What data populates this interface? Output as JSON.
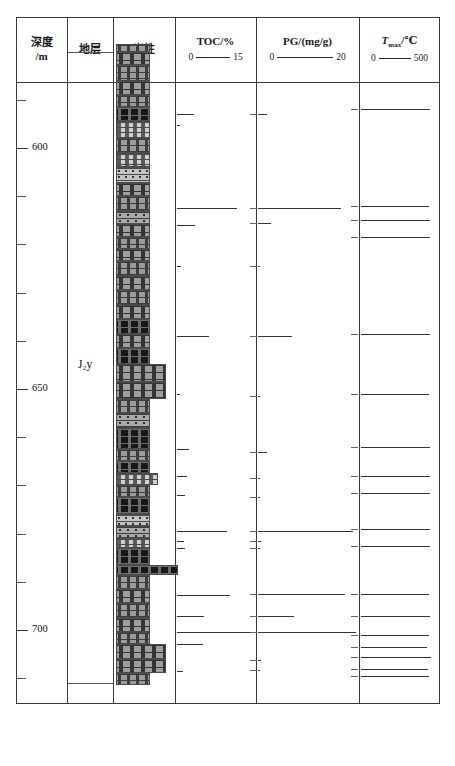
{
  "figure": {
    "type": "well-log-column",
    "title": "",
    "depth_unit": "m",
    "depth_range": [
      575,
      712
    ]
  },
  "header": {
    "columns": [
      {
        "id": "depth",
        "line1": "深度",
        "line2": "/m"
      },
      {
        "id": "strat",
        "line1": "地层",
        "line2": ""
      },
      {
        "id": "lith",
        "line1": "岩性",
        "line2": ""
      },
      {
        "id": "toc",
        "line1": "TOC/%",
        "line2": "",
        "min": "0",
        "max": "15"
      },
      {
        "id": "pg",
        "line1": "PG/(mg/g)",
        "line2": "",
        "min": "0",
        "max": "20"
      },
      {
        "id": "tmax",
        "line1": "T",
        "sub": "max",
        "line1b": "/℃",
        "min": "0",
        "max": "500"
      }
    ]
  },
  "depth_axis": {
    "labels": [
      {
        "value": "600",
        "depth": 600
      },
      {
        "value": "650",
        "depth": 650
      },
      {
        "value": "700",
        "depth": 700
      }
    ],
    "minor_tick_interval": 10
  },
  "stratigraphy": {
    "units": [
      {
        "label": "J₂y",
        "label_plain": "J2y",
        "top": 580,
        "bottom": 711
      }
    ]
  },
  "chart_data": {
    "type": "well-log",
    "title": "",
    "ylabel": "深度/m",
    "ylim": [
      575,
      712
    ],
    "tracks": [
      {
        "name": "TOC",
        "unit": "%",
        "xlim": [
          0,
          15
        ],
        "type": "bar",
        "points": [
          {
            "depth": 593.0,
            "value": 3.2
          },
          {
            "depth": 595.2,
            "value": 0.6
          },
          {
            "depth": 612.5,
            "value": 11.5
          },
          {
            "depth": 616.0,
            "value": 3.5
          },
          {
            "depth": 624.5,
            "value": 0.7
          },
          {
            "depth": 639.0,
            "value": 6.2
          },
          {
            "depth": 651.0,
            "value": 0.6
          },
          {
            "depth": 662.5,
            "value": 2.4
          },
          {
            "depth": 668.0,
            "value": 2.0
          },
          {
            "depth": 672.0,
            "value": 1.6
          },
          {
            "depth": 679.5,
            "value": 9.6
          },
          {
            "depth": 681.5,
            "value": 1.4
          },
          {
            "depth": 683.0,
            "value": 1.5
          },
          {
            "depth": 692.8,
            "value": 10.2
          },
          {
            "depth": 697.0,
            "value": 5.1
          },
          {
            "depth": 700.5,
            "value": 14.8
          },
          {
            "depth": 703.0,
            "value": 5.0
          },
          {
            "depth": 708.5,
            "value": 1.2
          }
        ]
      },
      {
        "name": "PG",
        "unit": "mg/g",
        "xlim": [
          0,
          20
        ],
        "type": "bar",
        "points": [
          {
            "depth": 593.0,
            "value": 1.9
          },
          {
            "depth": 612.5,
            "value": 16.8
          },
          {
            "depth": 615.5,
            "value": 2.7
          },
          {
            "depth": 624.5,
            "value": 0.5
          },
          {
            "depth": 639.0,
            "value": 6.9
          },
          {
            "depth": 651.5,
            "value": 0.5
          },
          {
            "depth": 663.0,
            "value": 1.9
          },
          {
            "depth": 668.5,
            "value": 0.5
          },
          {
            "depth": 672.5,
            "value": 0.4
          },
          {
            "depth": 679.5,
            "value": 19.2
          },
          {
            "depth": 681.5,
            "value": 0.7
          },
          {
            "depth": 683.0,
            "value": 0.5
          },
          {
            "depth": 692.5,
            "value": 17.5
          },
          {
            "depth": 697.0,
            "value": 7.3
          },
          {
            "depth": 700.5,
            "value": 19.8
          },
          {
            "depth": 706.2,
            "value": 0.6
          },
          {
            "depth": 708.4,
            "value": 0.5
          }
        ]
      },
      {
        "name": "Tmax",
        "unit": "℃",
        "xlim": [
          0,
          500
        ],
        "type": "bar",
        "points": [
          {
            "depth": 592.0,
            "value": 440
          },
          {
            "depth": 612.0,
            "value": 438
          },
          {
            "depth": 615.0,
            "value": 442
          },
          {
            "depth": 618.5,
            "value": 441
          },
          {
            "depth": 638.5,
            "value": 440
          },
          {
            "depth": 651.0,
            "value": 436
          },
          {
            "depth": 662.0,
            "value": 441
          },
          {
            "depth": 668.0,
            "value": 443
          },
          {
            "depth": 671.5,
            "value": 442
          },
          {
            "depth": 679.0,
            "value": 441
          },
          {
            "depth": 682.5,
            "value": 440
          },
          {
            "depth": 692.5,
            "value": 439
          },
          {
            "depth": 697.0,
            "value": 441
          },
          {
            "depth": 701.0,
            "value": 437
          },
          {
            "depth": 703.5,
            "value": 425
          },
          {
            "depth": 705.5,
            "value": 448
          },
          {
            "depth": 708.0,
            "value": 430
          },
          {
            "depth": 709.5,
            "value": 438
          }
        ]
      }
    ],
    "lithology_log": [
      {
        "depth_top": 578.5,
        "depth_bottom": 580.0,
        "code": "xly",
        "width": "narrow"
      },
      {
        "depth_top": 580.0,
        "depth_bottom": 582.8,
        "code": "ly",
        "width": "narrow"
      },
      {
        "depth_top": 582.8,
        "depth_bottom": 586.0,
        "code": "xly",
        "width": "narrow"
      },
      {
        "depth_top": 586.0,
        "depth_bottom": 589.0,
        "code": "ly",
        "width": "narrow"
      },
      {
        "depth_top": 589.0,
        "depth_bottom": 591.5,
        "code": "xly",
        "width": "narrow"
      },
      {
        "depth_top": 591.5,
        "depth_bottom": 594.5,
        "code": "tzny",
        "width": "narrow"
      },
      {
        "depth_top": 594.5,
        "depth_bottom": 598.0,
        "code": "ny",
        "width": "narrow"
      },
      {
        "depth_top": 598.0,
        "depth_bottom": 601.0,
        "code": "xly",
        "width": "narrow"
      },
      {
        "depth_top": 601.0,
        "depth_bottom": 604.0,
        "code": "ny",
        "width": "narrow"
      },
      {
        "depth_top": 604.0,
        "depth_bottom": 607.2,
        "code": "xsy",
        "width": "narrow"
      },
      {
        "depth_top": 607.2,
        "depth_bottom": 610.0,
        "code": "ly",
        "width": "narrow"
      },
      {
        "depth_top": 610.0,
        "depth_bottom": 613.0,
        "code": "xly",
        "width": "narrow"
      },
      {
        "depth_top": 613.0,
        "depth_bottom": 615.8,
        "code": "hlfsy",
        "width": "narrow"
      },
      {
        "depth_top": 615.8,
        "depth_bottom": 618.5,
        "code": "ly",
        "width": "narrow"
      },
      {
        "depth_top": 618.5,
        "depth_bottom": 621.0,
        "code": "xly",
        "width": "narrow"
      },
      {
        "depth_top": 621.0,
        "depth_bottom": 623.5,
        "code": "ly",
        "width": "narrow"
      },
      {
        "depth_top": 623.5,
        "depth_bottom": 626.5,
        "code": "xly",
        "width": "narrow"
      },
      {
        "depth_top": 626.5,
        "depth_bottom": 629.5,
        "code": "ly",
        "width": "narrow"
      },
      {
        "depth_top": 629.5,
        "depth_bottom": 632.5,
        "code": "xly",
        "width": "narrow"
      },
      {
        "depth_top": 632.5,
        "depth_bottom": 635.5,
        "code": "ly",
        "width": "narrow"
      },
      {
        "depth_top": 635.5,
        "depth_bottom": 638.5,
        "code": "tzny",
        "width": "narrow"
      },
      {
        "depth_top": 638.5,
        "depth_bottom": 641.5,
        "code": "ly",
        "width": "narrow"
      },
      {
        "depth_top": 641.5,
        "depth_bottom": 644.8,
        "code": "tzny",
        "width": "narrow"
      },
      {
        "depth_top": 644.8,
        "depth_bottom": 648.5,
        "code": "ly",
        "width": "wide"
      },
      {
        "depth_top": 648.5,
        "depth_bottom": 652.0,
        "code": "ly",
        "width": "wide"
      },
      {
        "depth_top": 652.0,
        "depth_bottom": 655.0,
        "code": "xly",
        "width": "narrow"
      },
      {
        "depth_top": 655.0,
        "depth_bottom": 658.0,
        "code": "hlfsy",
        "width": "narrow"
      },
      {
        "depth_top": 658.0,
        "depth_bottom": 662.5,
        "code": "tzny",
        "width": "narrow"
      },
      {
        "depth_top": 662.5,
        "depth_bottom": 665.0,
        "code": "xly",
        "width": "narrow"
      },
      {
        "depth_top": 665.0,
        "depth_bottom": 667.5,
        "code": "tzny",
        "width": "narrow"
      },
      {
        "depth_top": 667.5,
        "depth_bottom": 670.0,
        "code": "ny",
        "width": "medium"
      },
      {
        "depth_top": 670.0,
        "depth_bottom": 672.5,
        "code": "xly",
        "width": "narrow"
      },
      {
        "depth_top": 672.5,
        "depth_bottom": 676.0,
        "code": "tzny",
        "width": "narrow"
      },
      {
        "depth_top": 676.0,
        "depth_bottom": 678.5,
        "code": "xsy",
        "width": "narrow"
      },
      {
        "depth_top": 678.5,
        "depth_bottom": 681.0,
        "code": "hlfsy",
        "width": "narrow"
      },
      {
        "depth_top": 681.0,
        "depth_bottom": 683.0,
        "code": "ny",
        "width": "narrow"
      },
      {
        "depth_top": 683.0,
        "depth_bottom": 686.5,
        "code": "tzny",
        "width": "narrow"
      },
      {
        "depth_top": 686.5,
        "depth_bottom": 688.5,
        "code": "tzny",
        "width": "full"
      },
      {
        "depth_top": 688.5,
        "depth_bottom": 691.5,
        "code": "xly",
        "width": "narrow"
      },
      {
        "depth_top": 691.5,
        "depth_bottom": 694.5,
        "code": "ly",
        "width": "narrow"
      },
      {
        "depth_top": 694.5,
        "depth_bottom": 697.5,
        "code": "xly",
        "width": "narrow"
      },
      {
        "depth_top": 697.5,
        "depth_bottom": 700.5,
        "code": "ly",
        "width": "narrow"
      },
      {
        "depth_top": 700.5,
        "depth_bottom": 703.0,
        "code": "xly",
        "width": "narrow"
      },
      {
        "depth_top": 703.0,
        "depth_bottom": 706.0,
        "code": "ly",
        "width": "wide"
      },
      {
        "depth_top": 706.0,
        "depth_bottom": 709.0,
        "code": "ly",
        "width": "wide"
      },
      {
        "depth_top": 709.0,
        "depth_bottom": 711.5,
        "code": "xly",
        "width": "narrow"
      }
    ]
  },
  "legend": {
    "title": "图 例",
    "items": [
      {
        "code": "xly",
        "label": "细砾岩"
      },
      {
        "code": "ny",
        "label": "泥岩"
      },
      {
        "code": "hlfsy",
        "label": "含砾粉砂岩"
      },
      {
        "code": "ly",
        "label": "砾岩"
      },
      {
        "code": "xsy",
        "label": "细砂岩"
      },
      {
        "code": "tzny",
        "label": "炭质泥岩"
      }
    ]
  }
}
